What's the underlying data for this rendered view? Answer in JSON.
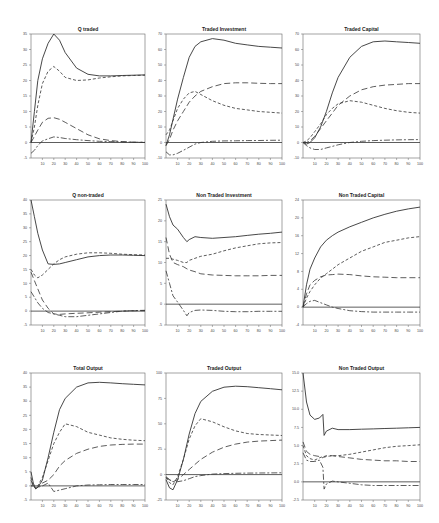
{
  "figure": {
    "x_ticks": [
      10,
      20,
      30,
      40,
      50,
      60,
      70,
      80,
      90,
      100
    ],
    "x_range": [
      0,
      100
    ],
    "line_color": "#333333",
    "panels_layout": "3x3 grid"
  },
  "chart_data": [
    {
      "type": "line",
      "title": "Q traded",
      "ylim": [
        -5,
        35
      ],
      "yticks": [
        35,
        30,
        25,
        20,
        15,
        10,
        5,
        0,
        -5
      ],
      "xlabel": "",
      "ylabel": "",
      "x": [
        0,
        3,
        6,
        10,
        15,
        20,
        25,
        30,
        40,
        50,
        60,
        70,
        80,
        90,
        100
      ],
      "series": [
        {
          "name": "total",
          "style": "solid",
          "values": [
            0,
            10,
            20,
            27,
            32,
            35,
            33,
            29,
            24,
            22,
            21.5,
            21.5,
            21.6,
            21.7,
            21.8
          ]
        },
        {
          "name": "component-1",
          "style": "dash",
          "values": [
            0,
            5,
            12,
            19,
            23,
            24.5,
            23,
            21,
            20,
            20.2,
            20.8,
            21.2,
            21.5,
            21.6,
            21.7
          ]
        },
        {
          "name": "component-2",
          "style": "longdash",
          "values": [
            0,
            2,
            4,
            6.5,
            7.8,
            8,
            7.5,
            6.5,
            4.5,
            2.5,
            1.2,
            0.6,
            0.3,
            0.1,
            0
          ]
        },
        {
          "name": "component-3",
          "style": "dashdot",
          "values": [
            -3.5,
            -2.5,
            -1,
            0.5,
            1.2,
            1.8,
            1.6,
            1.3,
            0.9,
            0.6,
            0.4,
            0.3,
            0.2,
            0.1,
            0.1
          ]
        }
      ]
    },
    {
      "type": "line",
      "title": "Traded Investment",
      "ylim": [
        -10,
        70
      ],
      "yticks": [
        70,
        60,
        50,
        40,
        30,
        20,
        10,
        0,
        -10
      ],
      "xlabel": "",
      "ylabel": "",
      "x": [
        0,
        3,
        6,
        10,
        15,
        20,
        25,
        30,
        40,
        50,
        60,
        70,
        80,
        90,
        100
      ],
      "series": [
        {
          "name": "total",
          "style": "solid",
          "values": [
            -2,
            5,
            15,
            28,
            42,
            55,
            62,
            65,
            67,
            66,
            64,
            63,
            62,
            61.5,
            61
          ]
        },
        {
          "name": "component-1",
          "style": "dash",
          "values": [
            5,
            8,
            14,
            22,
            28,
            32,
            33,
            31,
            27,
            24,
            22,
            21,
            20,
            19.5,
            19
          ]
        },
        {
          "name": "component-2",
          "style": "longdash",
          "values": [
            -2,
            2,
            8,
            14,
            20,
            26,
            30,
            33,
            36,
            38,
            38.5,
            38.5,
            38.2,
            38,
            38
          ]
        },
        {
          "name": "component-3",
          "style": "dashdot",
          "values": [
            -6,
            -8,
            -8,
            -7,
            -5,
            -3,
            -1,
            0,
            0.8,
            1,
            1.1,
            1.2,
            1.3,
            1.4,
            1.5
          ]
        }
      ]
    },
    {
      "type": "line",
      "title": "Traded Capital",
      "ylim": [
        -10,
        70
      ],
      "yticks": [
        70,
        60,
        50,
        40,
        30,
        20,
        10,
        0,
        -10
      ],
      "xlabel": "",
      "ylabel": "",
      "x": [
        0,
        3,
        6,
        10,
        15,
        20,
        25,
        30,
        40,
        50,
        60,
        70,
        80,
        90,
        100
      ],
      "series": [
        {
          "name": "total",
          "style": "solid",
          "values": [
            0,
            -1,
            0,
            3,
            10,
            20,
            32,
            42,
            55,
            62,
            65,
            65.5,
            65,
            64.5,
            64
          ]
        },
        {
          "name": "component-1",
          "style": "dash",
          "values": [
            0,
            1,
            3,
            7,
            12,
            18,
            22,
            25,
            27,
            26,
            24,
            22,
            20.5,
            19.5,
            19
          ]
        },
        {
          "name": "component-2",
          "style": "longdash",
          "values": [
            0,
            0,
            1,
            4,
            9,
            14,
            19,
            24,
            30,
            34,
            36,
            37,
            37.5,
            38,
            38
          ]
        },
        {
          "name": "component-3",
          "style": "dashdot",
          "values": [
            0,
            -2,
            -3.5,
            -4.5,
            -4.5,
            -3.5,
            -2.5,
            -1.5,
            0,
            0.8,
            1.2,
            1.5,
            1.7,
            1.8,
            1.9
          ]
        }
      ]
    },
    {
      "type": "line",
      "title": "Q non-traded",
      "ylim": [
        -5,
        40
      ],
      "yticks": [
        40,
        35,
        30,
        25,
        20,
        15,
        10,
        5,
        0,
        -5
      ],
      "xlabel": "",
      "ylabel": "",
      "x": [
        0,
        3,
        6,
        10,
        15,
        20,
        25,
        30,
        40,
        50,
        60,
        70,
        80,
        90,
        100
      ],
      "series": [
        {
          "name": "total",
          "style": "solid",
          "values": [
            40,
            34,
            28,
            22,
            17,
            16.8,
            17,
            17.5,
            18.5,
            19.5,
            20,
            20.2,
            20.2,
            20.1,
            20
          ]
        },
        {
          "name": "component-1",
          "style": "dash",
          "values": [
            15,
            13,
            12,
            13,
            15,
            17,
            18.5,
            19.5,
            20.5,
            21,
            21,
            20.8,
            20.5,
            20.3,
            20.2
          ]
        },
        {
          "name": "component-2",
          "style": "longdash",
          "values": [
            14,
            11,
            8,
            4,
            1,
            -1,
            -1.2,
            -1,
            -0.8,
            -0.6,
            -0.4,
            -0.2,
            0,
            0.1,
            0.2
          ]
        },
        {
          "name": "component-3",
          "style": "dashdot",
          "values": [
            7,
            5,
            3,
            1,
            -0.5,
            -1,
            -1.5,
            -2,
            -2,
            -1.5,
            -1,
            -0.5,
            0,
            0.2,
            0.3
          ]
        }
      ]
    },
    {
      "type": "line",
      "title": "Non Traded Investment",
      "ylim": [
        -5,
        25
      ],
      "yticks": [
        25,
        20,
        15,
        10,
        5,
        0,
        -5
      ],
      "xlabel": "",
      "ylabel": "",
      "x": [
        0,
        3,
        6,
        10,
        15,
        18,
        20,
        25,
        30,
        40,
        50,
        60,
        70,
        80,
        90,
        100
      ],
      "series": [
        {
          "name": "total",
          "style": "solid",
          "values": [
            24,
            21,
            19,
            18,
            16,
            15,
            15.5,
            16.2,
            16,
            15.8,
            16,
            16.2,
            16.5,
            16.8,
            17,
            17.3
          ]
        },
        {
          "name": "component-1",
          "style": "dash",
          "values": [
            11,
            11,
            10.8,
            10.5,
            10,
            10,
            10.5,
            11,
            11.5,
            12,
            12.8,
            13.5,
            14,
            14.5,
            14.7,
            14.8
          ]
        },
        {
          "name": "component-2",
          "style": "longdash",
          "values": [
            16,
            12,
            10,
            9.5,
            9,
            8.5,
            8.2,
            7.8,
            7.3,
            7,
            6.9,
            6.8,
            6.8,
            6.8,
            6.9,
            6.9
          ]
        },
        {
          "name": "component-3",
          "style": "dashdot",
          "values": [
            8,
            5,
            2,
            0.5,
            -1.5,
            -2.8,
            -2,
            -1.5,
            -1.4,
            -1.5,
            -1.7,
            -1.8,
            -1.8,
            -1.7,
            -1.7,
            -1.7
          ]
        }
      ]
    },
    {
      "type": "line",
      "title": "Non Traded Capital",
      "ylim": [
        -4,
        24
      ],
      "yticks": [
        24,
        20,
        16,
        12,
        8,
        4,
        0,
        -4
      ],
      "xlabel": "",
      "ylabel": "",
      "x": [
        0,
        3,
        6,
        10,
        15,
        20,
        25,
        30,
        40,
        50,
        60,
        70,
        80,
        90,
        100
      ],
      "series": [
        {
          "name": "total",
          "style": "solid",
          "values": [
            0,
            5,
            8.5,
            11,
            13.5,
            15,
            16,
            16.8,
            18,
            19,
            20,
            20.8,
            21.5,
            22,
            22.4
          ]
        },
        {
          "name": "component-1",
          "style": "dash",
          "values": [
            0,
            2,
            3.5,
            5,
            6.5,
            7.5,
            8.5,
            9.5,
            11,
            12.5,
            13.5,
            14.5,
            15,
            15.5,
            15.8
          ]
        },
        {
          "name": "component-2",
          "style": "longdash",
          "values": [
            0,
            3,
            5,
            6,
            6.8,
            7.2,
            7.3,
            7.4,
            7.3,
            7,
            6.8,
            6.7,
            6.6,
            6.6,
            6.6
          ]
        },
        {
          "name": "component-3",
          "style": "dashdot",
          "values": [
            0,
            0.8,
            1.3,
            1.5,
            1,
            0.5,
            0,
            -0.3,
            -0.8,
            -1,
            -1.1,
            -1.1,
            -1.1,
            -1.1,
            -1.1
          ]
        }
      ]
    },
    {
      "type": "line",
      "title": "Total Output",
      "ylim": [
        -5,
        40
      ],
      "yticks": [
        40,
        35,
        30,
        25,
        20,
        15,
        10,
        5,
        0,
        -5
      ],
      "xlabel": "",
      "ylabel": "",
      "x": [
        0,
        2,
        4,
        6,
        10,
        15,
        20,
        25,
        30,
        40,
        50,
        60,
        70,
        80,
        90,
        100
      ],
      "series": [
        {
          "name": "total",
          "style": "solid",
          "values": [
            5,
            1,
            -1,
            -0.5,
            2,
            10,
            19,
            27,
            31,
            35,
            36.5,
            36.7,
            36.5,
            36.2,
            36,
            35.8
          ]
        },
        {
          "name": "component-1",
          "style": "dash",
          "values": [
            3,
            0,
            -1,
            0,
            3,
            9,
            15,
            19,
            22,
            21,
            19,
            18,
            17,
            16.5,
            16.2,
            16
          ]
        },
        {
          "name": "component-2",
          "style": "longdash",
          "values": [
            2,
            0,
            -1,
            -0.5,
            1,
            2,
            4,
            7,
            9,
            11.5,
            13,
            14,
            14.5,
            14.7,
            14.8,
            14.8
          ]
        },
        {
          "name": "component-3",
          "style": "dashdot",
          "values": [
            0,
            0,
            -0.5,
            -0.5,
            0,
            1,
            -2,
            -1.5,
            -1,
            0,
            0.3,
            0.4,
            0.5,
            0.5,
            0.5,
            0.5
          ]
        }
      ]
    },
    {
      "type": "line",
      "title": "Traded Output",
      "ylim": [
        -25,
        100
      ],
      "yticks": [
        100,
        75,
        50,
        25,
        0,
        -25
      ],
      "xlabel": "",
      "ylabel": "",
      "x": [
        0,
        3,
        6,
        10,
        15,
        20,
        25,
        30,
        40,
        50,
        60,
        70,
        80,
        90,
        100
      ],
      "series": [
        {
          "name": "total",
          "style": "solid",
          "values": [
            -5,
            -13,
            -15,
            -5,
            15,
            40,
            60,
            72,
            82,
            86,
            87,
            86.5,
            85.5,
            84.5,
            83.5
          ]
        },
        {
          "name": "component-1",
          "style": "dash",
          "values": [
            -3,
            -8,
            -10,
            -2,
            15,
            35,
            48,
            55,
            52,
            47,
            43,
            40.5,
            39.5,
            39,
            38.5
          ]
        },
        {
          "name": "component-2",
          "style": "longdash",
          "values": [
            -3,
            -5,
            -7,
            -5,
            0,
            5,
            10,
            15,
            22,
            27,
            30,
            32,
            33,
            33.5,
            34
          ]
        },
        {
          "name": "component-3",
          "style": "dashdot",
          "values": [
            -2,
            -5,
            -7,
            -7,
            -6,
            -4,
            -2,
            -1,
            0.5,
            1,
            1.3,
            1.5,
            1.6,
            1.7,
            1.8
          ]
        }
      ]
    },
    {
      "type": "line",
      "title": "Non Traded Output",
      "ylim": [
        -2.5,
        15.0
      ],
      "yticks": [
        15.0,
        12.5,
        10.0,
        7.5,
        5.0,
        2.5,
        0.0,
        -2.5
      ],
      "xlabel": "",
      "ylabel": "",
      "x": [
        0,
        3,
        6,
        10,
        14,
        17,
        18,
        20,
        25,
        30,
        40,
        50,
        60,
        70,
        80,
        90,
        100
      ],
      "series": [
        {
          "name": "total",
          "style": "solid",
          "values": [
            15,
            11,
            9.2,
            8.6,
            8.8,
            9.3,
            6.4,
            7,
            7.4,
            7.2,
            7.2,
            7.25,
            7.3,
            7.35,
            7.4,
            7.45,
            7.5
          ]
        },
        {
          "name": "component-1",
          "style": "dash",
          "values": [
            5,
            3.6,
            3.2,
            3.0,
            3.3,
            3.5,
            3.4,
            3.5,
            3.6,
            3.6,
            3.8,
            4.1,
            4.4,
            4.7,
            4.9,
            5.0,
            5.1
          ]
        },
        {
          "name": "component-2",
          "style": "longdash",
          "values": [
            5.5,
            4.2,
            3.8,
            3.6,
            3.5,
            3.3,
            3.5,
            3.6,
            3.6,
            3.5,
            3.3,
            3.1,
            3.0,
            2.9,
            2.9,
            2.8,
            2.8
          ]
        },
        {
          "name": "component-3",
          "style": "dashdot",
          "values": [
            4,
            3,
            2.8,
            2.8,
            3,
            2,
            -1,
            -0.3,
            0.1,
            0,
            -0.2,
            -0.4,
            -0.5,
            -0.5,
            -0.5,
            -0.5,
            -0.5
          ]
        }
      ]
    }
  ]
}
